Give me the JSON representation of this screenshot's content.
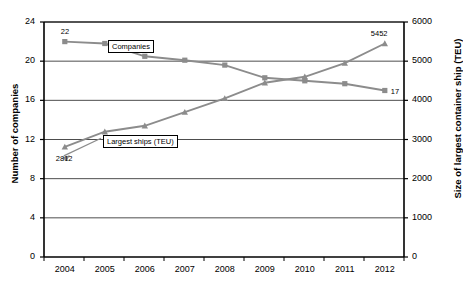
{
  "chart_data": {
    "type": "line",
    "title": "",
    "xlabel": "",
    "categories": [
      "2004",
      "2005",
      "2006",
      "2007",
      "2008",
      "2009",
      "2010",
      "2011",
      "2012"
    ],
    "grid": true,
    "legend_position": "inline-labels",
    "axes": {
      "left": {
        "label": "Number of companies",
        "ticks": [
          0,
          4,
          8,
          12,
          16,
          20,
          24
        ],
        "tick_labels": [
          "0",
          "4",
          "8",
          "12",
          "16",
          "20",
          "24"
        ],
        "ylim": [
          0,
          24
        ]
      },
      "right": {
        "label": "Size of largest container ship (TEU)",
        "ticks": [
          0,
          1000,
          2000,
          3000,
          4000,
          5000,
          6000
        ],
        "tick_labels": [
          "0",
          "1000",
          "2000",
          "3000",
          "4000",
          "5000",
          "6000"
        ],
        "ylim": [
          0,
          6000
        ]
      }
    },
    "series": [
      {
        "name": "Companies",
        "label": "Companies",
        "axis": "left",
        "marker": "square",
        "color": "#8C8C8C",
        "values": [
          22,
          21.8,
          20.5,
          20.1,
          19.6,
          18.3,
          18.0,
          17.7,
          17
        ]
      },
      {
        "name": "Largest ships (TEU)",
        "label": "Largest ships (TEU)",
        "axis": "right",
        "marker": "triangle",
        "color": "#8C8C8C",
        "values": [
          2812,
          3200,
          3350,
          3700,
          4050,
          4450,
          4600,
          4950,
          5452
        ]
      }
    ],
    "annotations": [
      {
        "text": "22",
        "series": "Companies",
        "point_index": 0
      },
      {
        "text": "17",
        "series": "Companies",
        "point_index": 8
      },
      {
        "text": "2812",
        "series": "Largest ships (TEU)",
        "point_index": 0
      },
      {
        "text": "5452",
        "series": "Largest ships (TEU)",
        "point_index": 8
      }
    ]
  }
}
